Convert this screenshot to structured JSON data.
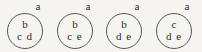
{
  "figure": {
    "type": "set-diagram",
    "background_color": "#f6f4f0",
    "stroke_color": "#5a564f",
    "text_color": "#2e2b27",
    "nodes": [
      {
        "outer_label": "a",
        "top_label": "b",
        "bottom_label": "c d",
        "members": [
          "b",
          "c",
          "d"
        ]
      },
      {
        "outer_label": "a",
        "top_label": "b",
        "bottom_label": "c e",
        "members": [
          "b",
          "c",
          "e"
        ]
      },
      {
        "outer_label": "a",
        "top_label": "b",
        "bottom_label": "d e",
        "members": [
          "b",
          "d",
          "e"
        ]
      },
      {
        "outer_label": "a",
        "top_label": "c",
        "bottom_label": "d e",
        "members": [
          "c",
          "d",
          "e"
        ]
      }
    ]
  }
}
